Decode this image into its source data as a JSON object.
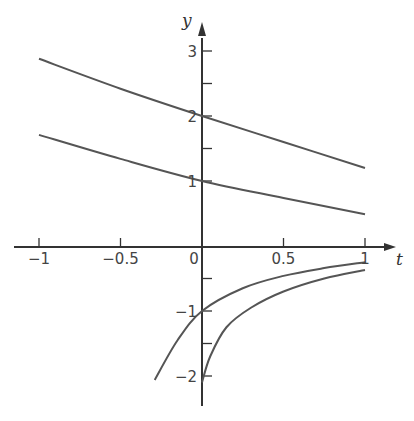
{
  "chart_data": {
    "type": "line",
    "title": "",
    "xlabel": "t",
    "ylabel": "y",
    "xlim": [
      -1,
      1
    ],
    "ylim": [
      -2.2,
      3.3
    ],
    "grid": false,
    "x_ticks": [
      -1,
      -0.5,
      0,
      0.5,
      1
    ],
    "x_tick_labels": [
      "−1",
      "−0.5",
      "0",
      "0.5",
      "1"
    ],
    "y_ticks": [
      -2,
      -1.5,
      -1,
      -0.5,
      1,
      1.5,
      2,
      2.5,
      3
    ],
    "y_tick_labels": {
      "3": "3",
      "2": "2",
      "1": "1",
      "-1": "−1",
      "-2": "−2"
    },
    "series": [
      {
        "name": "solution y(0)=2",
        "x": [
          -1,
          -0.5,
          0,
          0.5,
          1
        ],
        "y": [
          2.88,
          2.42,
          2.0,
          1.6,
          1.2
        ]
      },
      {
        "name": "solution y(0)=1",
        "x": [
          -1,
          -0.5,
          0,
          0.5,
          1
        ],
        "y": [
          1.71,
          1.34,
          1.0,
          0.74,
          0.49
        ]
      },
      {
        "name": "solution y(0)=-1",
        "x": [
          -0.29,
          -0.15,
          0,
          0.25,
          0.5,
          0.75,
          1
        ],
        "y": [
          -2.06,
          -1.45,
          -1.0,
          -0.65,
          -0.46,
          -0.34,
          -0.25
        ]
      },
      {
        "name": "solution y(0)=-2",
        "x": [
          0,
          0.05,
          0.15,
          0.3,
          0.5,
          0.75,
          1
        ],
        "y": [
          -2.1,
          -1.7,
          -1.25,
          -0.95,
          -0.7,
          -0.5,
          -0.37
        ]
      }
    ]
  },
  "labels": {
    "x_axis": "t",
    "y_axis": "y",
    "origin": "0"
  }
}
